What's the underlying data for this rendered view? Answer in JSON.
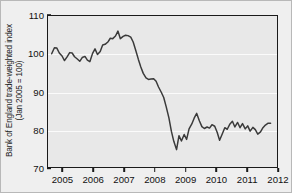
{
  "figure": {
    "background_color": "#efefef",
    "plot_background_color": "#e8e8e8",
    "frame_color": "#1a1a1a",
    "line_color": "#3a3a3a",
    "gridline_color": "#fbfbfb"
  },
  "chart_data": {
    "type": "line",
    "title": "",
    "subtitle": "",
    "xlabel": "",
    "ylabel": "Bank of England trade-weighted index\n(Jan 2005 = 100)",
    "ylabel_lines": [
      "Bank of England trade-weighted index",
      "(Jan 2005 = 100)"
    ],
    "xlim": [
      2004.5,
      2012.0
    ],
    "ylim": [
      70,
      110
    ],
    "yticks": [
      70,
      80,
      90,
      100,
      110
    ],
    "ytick_labels": [
      "70",
      "80",
      "90",
      "100",
      "110"
    ],
    "xticks": [
      2005,
      2006,
      2007,
      2008,
      2009,
      2010,
      2011,
      2012
    ],
    "xtick_labels": [
      "2005",
      "2006",
      "2007",
      "2008",
      "2009",
      "2010",
      "2011",
      "2012"
    ],
    "grid": true,
    "grid_axis": "y",
    "legend": null,
    "legend_position": "none",
    "annotations": [],
    "series": [
      {
        "name": "Bank of England trade-weighted index",
        "color": "#3a3a3a",
        "x": [
          2004.62,
          2004.71,
          2004.79,
          2004.87,
          2004.96,
          2005.04,
          2005.12,
          2005.21,
          2005.29,
          2005.37,
          2005.46,
          2005.54,
          2005.62,
          2005.71,
          2005.79,
          2005.87,
          2005.96,
          2006.04,
          2006.12,
          2006.21,
          2006.29,
          2006.37,
          2006.46,
          2006.54,
          2006.62,
          2006.71,
          2006.79,
          2006.87,
          2006.96,
          2007.04,
          2007.12,
          2007.21,
          2007.29,
          2007.37,
          2007.46,
          2007.54,
          2007.62,
          2007.71,
          2007.79,
          2007.87,
          2007.96,
          2008.04,
          2008.12,
          2008.21,
          2008.29,
          2008.37,
          2008.46,
          2008.54,
          2008.62,
          2008.71,
          2008.79,
          2008.87,
          2008.96,
          2009.04,
          2009.12,
          2009.21,
          2009.29,
          2009.37,
          2009.46,
          2009.54,
          2009.62,
          2009.71,
          2009.79,
          2009.87,
          2009.96,
          2010.04,
          2010.12,
          2010.21,
          2010.29,
          2010.37,
          2010.46,
          2010.54,
          2010.62,
          2010.71,
          2010.79,
          2010.87,
          2010.96,
          2011.04,
          2011.12,
          2011.21,
          2011.29,
          2011.37,
          2011.46,
          2011.54,
          2011.62,
          2011.71,
          2011.79
        ],
        "y": [
          100.0,
          101.6,
          101.5,
          100.2,
          99.4,
          98.2,
          99.1,
          100.3,
          100.2,
          99.2,
          98.6,
          98.0,
          99.0,
          99.3,
          98.3,
          97.9,
          100.1,
          101.3,
          99.8,
          100.6,
          102.3,
          102.5,
          103.1,
          104.1,
          104.0,
          104.7,
          106.0,
          104.0,
          104.6,
          104.9,
          104.8,
          104.4,
          103.1,
          101.0,
          98.5,
          96.5,
          94.8,
          93.6,
          93.2,
          93.3,
          93.4,
          92.7,
          91.2,
          89.8,
          88.4,
          86.0,
          83.0,
          79.5,
          76.8,
          74.6,
          78.3,
          76.9,
          78.6,
          77.3,
          80.1,
          81.4,
          83.0,
          84.2,
          82.2,
          80.7,
          80.2,
          80.6,
          80.3,
          81.2,
          80.8,
          79.2,
          77.1,
          78.8,
          80.4,
          80.0,
          81.4,
          82.1,
          80.6,
          81.8,
          80.4,
          81.5,
          80.1,
          80.9,
          79.5,
          80.5,
          79.9,
          78.7,
          79.3,
          80.4,
          81.1,
          81.6,
          81.6
        ]
      }
    ]
  }
}
